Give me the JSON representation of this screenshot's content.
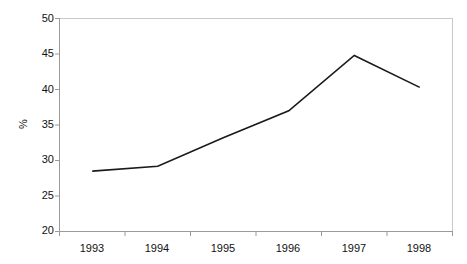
{
  "chart_data": {
    "type": "line",
    "title": "",
    "subtitle": "",
    "xlabel": "",
    "ylabel": "%",
    "categories": [
      "1993",
      "1994",
      "1995",
      "1996",
      "1997",
      "1998"
    ],
    "series": [
      {
        "name": "",
        "values": [
          28.5,
          29.2,
          33.2,
          37.0,
          44.8,
          40.3
        ]
      }
    ],
    "ylim": [
      20,
      50
    ],
    "yticks": [
      20,
      25,
      30,
      35,
      40,
      45,
      50
    ],
    "ytick_labels": [
      "20",
      "25",
      "30",
      "35",
      "40",
      "45",
      "50"
    ],
    "grid": false,
    "legend": "none",
    "line_color": "#1a1a1a",
    "axis_color": "#8a8a8a",
    "markers": false,
    "annotations": []
  }
}
